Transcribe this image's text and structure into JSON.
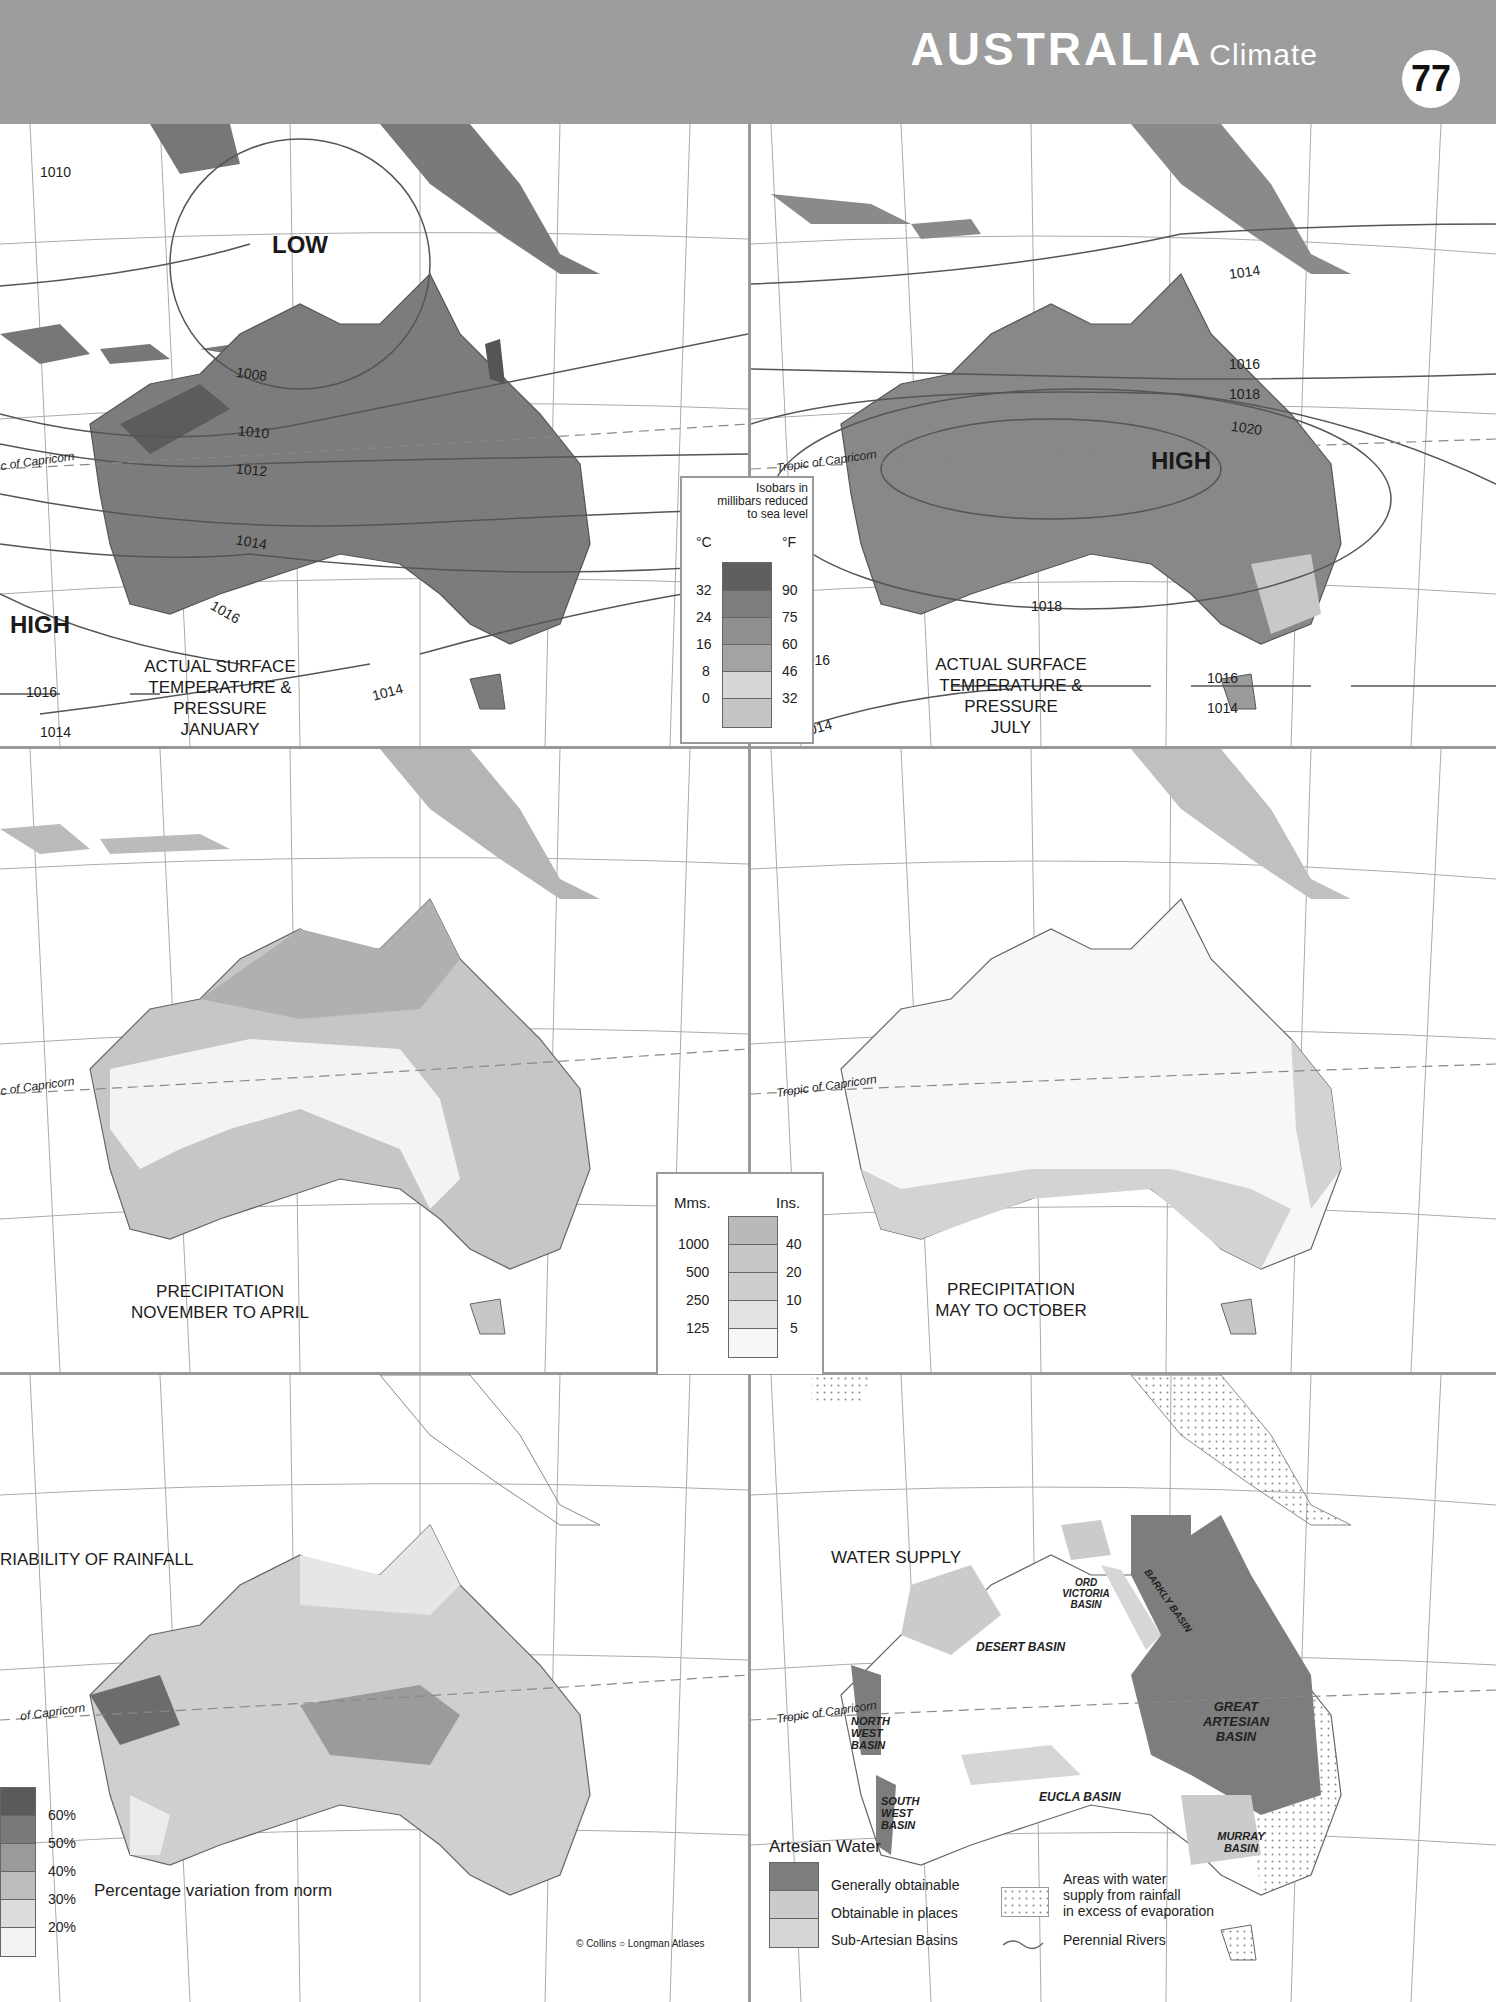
{
  "header": {
    "title": "AUSTRALIA",
    "subtitle": "Climate",
    "page_number": "77"
  },
  "maps": {
    "jan": {
      "title_lines": [
        "ACTUAL SURFACE",
        "TEMPERATURE & PRESSURE",
        "JANUARY"
      ],
      "pressure_labels": [
        "LOW",
        "HIGH"
      ],
      "isobars": [
        "1010",
        "1008",
        "1010",
        "1012",
        "1014",
        "1016",
        "1016",
        "1014",
        "1014"
      ],
      "tropic_label": "c of Capricorn"
    },
    "jul": {
      "title_lines": [
        "ACTUAL SURFACE",
        "TEMPERATURE & PRESSURE",
        "JULY"
      ],
      "pressure_labels": [
        "HIGH"
      ],
      "isobars": [
        "1014",
        "1016",
        "1018",
        "1020",
        "1018",
        "1016",
        "1016",
        "1014",
        "1014"
      ],
      "tropic_label": "Tropic of Capricorn"
    },
    "precip_nov_apr": {
      "title_lines": [
        "PRECIPITATION",
        "NOVEMBER TO APRIL"
      ],
      "tropic_label": "c of Capricorn"
    },
    "precip_may_oct": {
      "title_lines": [
        "PRECIPITATION",
        "MAY TO OCTOBER"
      ],
      "tropic_label": "Tropic of Capricorn"
    },
    "variability": {
      "title": "RIABILITY OF RAINFALL",
      "tropic_label": "of Capricorn",
      "legend_caption": "Percentage variation from norm",
      "legend_values": [
        "60%",
        "50%",
        "40%",
        "30%",
        "20%"
      ]
    },
    "water": {
      "title": "WATER SUPPLY",
      "tropic_label": "Tropic of Capricorn",
      "basins": [
        "ORD VICTORIA BASIN",
        "BARKLY BASIN",
        "DESERT BASIN",
        "GREAT ARTESIAN BASIN",
        "NORTH WEST BASIN",
        "SOUTH WEST BASIN",
        "EUCLA BASIN",
        "MURRAY BASIN"
      ],
      "legend_title": "Artesian Water",
      "legend_items": [
        "Generally obtainable",
        "Obtainable in places",
        "Sub-Artesian Basins"
      ],
      "legend_extra": [
        "Areas with water",
        "supply from rainfall",
        "in excess of evaporation"
      ],
      "rivers_label": "Perennial Rivers"
    }
  },
  "temp_legend": {
    "isobar_note": [
      "Isobars in",
      "millibars reduced",
      "to sea level"
    ],
    "unit_c": "°C",
    "unit_f": "°F",
    "celsius": [
      "32",
      "24",
      "16",
      "8",
      "0"
    ],
    "fahrenheit": [
      "90",
      "75",
      "60",
      "46",
      "32"
    ],
    "colors": [
      "#5f5f5f",
      "#7d7d7d",
      "#8f8f8f",
      "#a3a3a3",
      "#d6d6d6",
      "#c4c4c4"
    ]
  },
  "precip_legend": {
    "unit_mm": "Mms.",
    "unit_in": "Ins.",
    "mm": [
      "1000",
      "500",
      "250",
      "125"
    ],
    "inches": [
      "40",
      "20",
      "10",
      "5"
    ],
    "colors": [
      "#b9b9b9",
      "#c6c6c6",
      "#cdcdcd",
      "#e3e3e3",
      "#f7f7f7"
    ]
  },
  "credit": "© Collins ○ Longman Atlases"
}
